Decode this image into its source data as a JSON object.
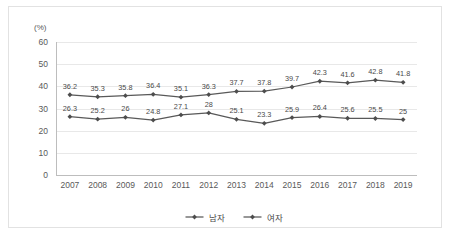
{
  "chart_data": {
    "type": "line",
    "title": "",
    "subtitle": "",
    "xlabel": "",
    "ylabel": "",
    "unit_label": "(%)",
    "categories": [
      "2007",
      "2008",
      "2009",
      "2010",
      "2011",
      "2012",
      "2013",
      "2014",
      "2015",
      "2016",
      "2017",
      "2018",
      "2019"
    ],
    "series": [
      {
        "name": "남자",
        "values": [
          36.2,
          35.3,
          35.8,
          36.4,
          35.1,
          36.3,
          37.7,
          37.8,
          39.7,
          42.3,
          41.6,
          42.8,
          41.8
        ],
        "labels": [
          "36.2",
          "35.3",
          "35.8",
          "36.4",
          "35.1",
          "36.3",
          "37.7",
          "37.8",
          "39.7",
          "42.3",
          "41.6",
          "42.8",
          "41.8"
        ],
        "color": "#595959",
        "marker": "diamond"
      },
      {
        "name": "여자",
        "values": [
          26.3,
          25.2,
          26.0,
          24.8,
          27.1,
          28.0,
          25.1,
          23.3,
          25.9,
          26.4,
          25.6,
          25.5,
          25.0
        ],
        "labels": [
          "26.3",
          "25.2",
          "26",
          "24.8",
          "27.1",
          "28",
          "25.1",
          "23.3",
          "25.9",
          "26.4",
          "25.6",
          "25.5",
          "25"
        ],
        "color": "#595959",
        "marker": "diamond"
      }
    ],
    "ylim": [
      0,
      60
    ],
    "yticks": [
      0,
      10,
      20,
      30,
      40,
      50,
      60
    ],
    "ytick_labels": [
      "0",
      "10",
      "20",
      "30",
      "40",
      "50",
      "60"
    ],
    "grid": true,
    "grid_axis": "y",
    "legend_position": "bottom",
    "legend_entries": [
      "남자",
      "여자"
    ],
    "background_color": "#ffffff",
    "gridline_color": "#e8e8e8",
    "axis_color": "#bdbdbd",
    "border_color": "#e2e2e2"
  }
}
